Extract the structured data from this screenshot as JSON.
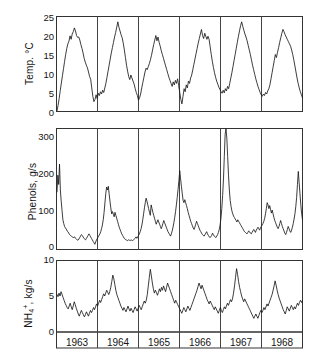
{
  "figure": {
    "background": "#ffffff",
    "line_color": "#1a1a1a",
    "frame_color": "#333333"
  },
  "panels": {
    "temperature": {
      "axis_label": "Temp. °C",
      "tick_labels": [
        "0",
        "5",
        "10",
        "15",
        "20",
        "25"
      ]
    },
    "phenols": {
      "axis_label": "Phenols, g/s",
      "tick_labels": [
        "0",
        "100",
        "200",
        "300"
      ]
    },
    "ammonium": {
      "axis_label_html": "NH<sub>4</sub><sup>+</sup>, kg/s",
      "axis_label": "NH4+, kg/s",
      "tick_labels": [
        "0",
        "5",
        "10"
      ]
    }
  },
  "years": [
    "1963",
    "1964",
    "1965",
    "1966",
    "1967",
    "1968"
  ],
  "chart_data": [
    {
      "type": "line",
      "title": "",
      "xlabel": "",
      "ylabel": "Temp. °C",
      "ylim": [
        0,
        25
      ],
      "yticks": [
        0,
        5,
        10,
        15,
        20,
        25
      ],
      "grid": false,
      "legend": "none",
      "x_categories": [
        "1963",
        "1964",
        "1965",
        "1966",
        "1967",
        "1968"
      ],
      "x_unit": "month",
      "series": [
        {
          "name": "Water temperature",
          "units": "°C",
          "values": [
            0.2,
            1.6,
            3.4,
            5.5,
            7.5,
            9.4,
            11.3,
            13.2,
            15.0,
            16.6,
            17.8,
            18.5,
            19.9,
            19.0,
            20.4,
            21.0,
            22.0,
            21.2,
            20.0,
            19.5,
            19.6,
            18.8,
            17.6,
            16.6,
            15.4,
            14.0,
            13.0,
            12.2,
            11.5,
            10.4,
            9.2,
            8.5,
            6.2,
            4.0,
            2.6,
            3.2,
            4.4,
            3.4,
            4.8,
            4.2,
            5.2,
            4.6,
            5.6,
            5.0,
            6.2,
            7.4,
            9.0,
            10.6,
            12.2,
            13.8,
            15.4,
            16.8,
            18.2,
            19.6,
            20.8,
            22.2,
            23.6,
            22.2,
            21.2,
            20.2,
            19.4,
            18.0,
            16.2,
            14.2,
            12.2,
            10.6,
            9.2,
            8.4,
            9.6,
            8.8,
            8.0,
            7.2,
            6.0,
            5.0,
            4.2,
            3.0,
            3.6,
            4.6,
            6.2,
            7.6,
            9.0,
            10.4,
            11.4,
            11.0,
            11.8,
            12.6,
            13.6,
            14.8,
            16.2,
            17.6,
            18.8,
            20.0,
            18.6,
            19.6,
            18.2,
            17.2,
            16.0,
            15.0,
            14.0,
            13.0,
            12.0,
            11.0,
            10.0,
            9.0,
            8.2,
            7.4,
            6.6,
            7.8,
            7.0,
            8.2,
            7.4,
            8.6,
            6.8,
            5.0,
            3.2,
            2.0,
            4.0,
            6.0,
            5.2,
            7.0,
            6.2,
            8.0,
            7.4,
            8.8,
            9.6,
            11.0,
            12.4,
            13.8,
            15.2,
            16.6,
            18.0,
            19.2,
            20.4,
            21.6,
            20.0,
            19.2,
            20.6,
            19.8,
            19.0,
            19.8,
            19.0,
            17.0,
            15.0,
            13.2,
            11.6,
            10.2,
            9.0,
            8.0,
            7.2,
            6.4,
            5.8,
            5.2,
            4.8,
            5.6,
            4.9,
            6.0,
            5.4,
            6.6,
            6.0,
            7.4,
            8.8,
            10.2,
            11.8,
            13.4,
            15.0,
            16.6,
            18.2,
            19.8,
            21.2,
            22.6,
            23.6,
            22.4,
            21.4,
            20.4,
            19.6,
            18.6,
            17.4,
            16.2,
            15.0,
            13.6,
            12.2,
            11.0,
            9.8,
            8.6,
            7.6,
            6.6,
            5.8,
            5.0,
            4.4,
            4.0,
            4.6,
            4.2,
            5.0,
            4.6,
            5.4,
            6.0,
            7.0,
            8.6,
            10.2,
            11.8,
            13.4,
            15.0,
            14.2,
            15.6,
            16.8,
            18.2,
            19.4,
            20.6,
            21.6,
            21.0,
            20.2,
            19.6,
            19.0,
            18.4,
            17.8,
            17.2,
            16.2,
            15.0,
            13.6,
            12.0,
            10.4,
            8.8,
            7.4,
            6.2,
            5.2,
            4.4,
            3.6
          ]
        }
      ]
    },
    {
      "type": "line",
      "title": "",
      "xlabel": "",
      "ylabel": "Phenols, g/s",
      "ylim": [
        0,
        340
      ],
      "yticks": [
        0,
        100,
        200,
        300
      ],
      "grid": false,
      "legend": "none",
      "x_categories": [
        "1963",
        "1964",
        "1965",
        "1966",
        "1967",
        "1968"
      ],
      "x_unit": "month",
      "series": [
        {
          "name": "Phenols discharge",
          "units": "g/s",
          "values": [
            155,
            200,
            175,
            230,
            160,
            130,
            105,
            80,
            70,
            62,
            58,
            55,
            50,
            48,
            44,
            40,
            38,
            36,
            34,
            33,
            32,
            34,
            30,
            28,
            26,
            25,
            28,
            32,
            36,
            40,
            38,
            34,
            30,
            28,
            26,
            30,
            34,
            38,
            42,
            38,
            34,
            30,
            26,
            22,
            18,
            14,
            20,
            26,
            30,
            34,
            38,
            42,
            48,
            56,
            66,
            80,
            100,
            125,
            150,
            168,
            160,
            170,
            150,
            130,
            112,
            96,
            102,
            95,
            88,
            100,
            92,
            84,
            76,
            68,
            60,
            54,
            48,
            42,
            38,
            34,
            30,
            28,
            26,
            25,
            24,
            26,
            25,
            24,
            26,
            25,
            24,
            26,
            28,
            30,
            34,
            30,
            34,
            38,
            42,
            48,
            56,
            66,
            80,
            96,
            112,
            126,
            138,
            130,
            120,
            110,
            100,
            92,
            120,
            110,
            100,
            92,
            84,
            76,
            68,
            74,
            80,
            74,
            68,
            62,
            56,
            62,
            70,
            78,
            72,
            66,
            60,
            54,
            48,
            44,
            40,
            36,
            42,
            50,
            60,
            72,
            86,
            102,
            120,
            140,
            162,
            186,
            212,
            190,
            170,
            150,
            132,
            126,
            134,
            126,
            118,
            110,
            100,
            92,
            84,
            76,
            70,
            64,
            58,
            54,
            60,
            68,
            76,
            70,
            64,
            58,
            52,
            48,
            44,
            40,
            38,
            36,
            40,
            44,
            48,
            42,
            38,
            34,
            32,
            34,
            38,
            44,
            40,
            36,
            34,
            32,
            36,
            40,
            46,
            54,
            66,
            84,
            110,
            145,
            190,
            250,
            310,
            340,
            300,
            250,
            200,
            160,
            132,
            116,
            104,
            96,
            90,
            86,
            82,
            78,
            74,
            80,
            76,
            72,
            68,
            64,
            60,
            56,
            52,
            48,
            46,
            44,
            42,
            46,
            50,
            48,
            44,
            42,
            46,
            50,
            54,
            50,
            46,
            52,
            56,
            60,
            56,
            52,
            58,
            62,
            66,
            70,
            76,
            84,
            96,
            110,
            126,
            120,
            110,
            118,
            108,
            98,
            106,
            96,
            86,
            78,
            72,
            66,
            60,
            56,
            62,
            70,
            78,
            70,
            62,
            56,
            50,
            44,
            40,
            46,
            54,
            62,
            56,
            50,
            46,
            52,
            60,
            70,
            82,
            96,
            115,
            140,
            175,
            210,
            180,
            150,
            120,
            96,
            80
          ]
        }
      ]
    },
    {
      "type": "line",
      "title": "",
      "xlabel": "",
      "ylabel": "NH4+, kg/s",
      "ylim": [
        0,
        10
      ],
      "yticks": [
        0,
        5,
        10
      ],
      "grid": false,
      "legend": "none",
      "x_categories": [
        "1963",
        "1964",
        "1965",
        "1966",
        "1967",
        "1968"
      ],
      "x_unit": "month",
      "series": [
        {
          "name": "Ammonium discharge",
          "units": "kg/s",
          "values": [
            5.2,
            4.9,
            5.4,
            5.0,
            5.6,
            5.2,
            4.8,
            4.4,
            4.0,
            3.7,
            3.4,
            3.2,
            3.6,
            4.0,
            3.5,
            3.1,
            3.6,
            4.2,
            3.8,
            3.3,
            2.9,
            2.5,
            2.2,
            2.6,
            3.0,
            2.7,
            2.4,
            2.1,
            2.4,
            2.8,
            2.5,
            2.2,
            2.6,
            3.0,
            2.7,
            3.0,
            3.4,
            3.1,
            3.5,
            3.9,
            3.6,
            4.0,
            4.4,
            4.1,
            4.5,
            4.9,
            5.3,
            5.0,
            5.4,
            5.8,
            5.5,
            5.2,
            5.6,
            6.2,
            7.0,
            7.9,
            7.4,
            6.6,
            5.8,
            5.2,
            4.8,
            4.4,
            4.0,
            3.6,
            3.3,
            3.0,
            3.4,
            3.1,
            2.8,
            3.2,
            3.6,
            3.2,
            2.9,
            3.3,
            3.0,
            2.7,
            3.1,
            3.5,
            3.2,
            2.9,
            3.3,
            3.7,
            3.4,
            3.1,
            3.5,
            3.9,
            4.3,
            4.0,
            4.4,
            5.2,
            6.4,
            7.6,
            8.7,
            7.8,
            6.8,
            6.0,
            5.4,
            5.8,
            5.5,
            5.1,
            5.5,
            6.0,
            5.6,
            6.2,
            5.8,
            6.4,
            6.0,
            5.6,
            6.2,
            6.8,
            6.4,
            6.0,
            5.6,
            5.2,
            4.8,
            4.4,
            4.0,
            4.4,
            4.1,
            3.8,
            3.5,
            3.2,
            2.9,
            2.6,
            3.0,
            3.4,
            3.1,
            2.8,
            3.2,
            3.6,
            3.3,
            3.0,
            3.4,
            3.8,
            4.2,
            4.6,
            5.0,
            5.4,
            5.8,
            6.3,
            6.8,
            6.4,
            6.0,
            6.5,
            6.1,
            5.7,
            5.3,
            4.9,
            4.5,
            4.2,
            3.9,
            4.3,
            4.0,
            3.7,
            3.4,
            3.1,
            3.5,
            3.2,
            2.9,
            2.6,
            3.0,
            3.4,
            3.0,
            2.7,
            3.1,
            3.5,
            3.2,
            3.6,
            4.0,
            3.7,
            4.1,
            4.5,
            4.2,
            4.6,
            5.4,
            6.4,
            7.6,
            8.8,
            8.0,
            7.0,
            6.2,
            5.6,
            5.0,
            4.6,
            4.2,
            4.6,
            4.3,
            4.0,
            3.7,
            3.4,
            3.1,
            2.8,
            2.5,
            2.2,
            1.9,
            2.2,
            2.5,
            2.2,
            1.9,
            2.3,
            2.7,
            3.0,
            2.7,
            3.0,
            3.4,
            3.1,
            3.5,
            3.9,
            3.6,
            4.0,
            4.4,
            4.8,
            5.2,
            5.8,
            6.4,
            7.1,
            6.5,
            5.8,
            5.2,
            4.7,
            4.3,
            3.9,
            3.5,
            3.1,
            2.8,
            2.5,
            3.0,
            3.5,
            3.2,
            2.9,
            3.3,
            3.7,
            3.4,
            3.1,
            3.5,
            3.2,
            3.6,
            4.0,
            3.7,
            4.1,
            4.4,
            4.1,
            4.4
          ]
        }
      ]
    }
  ]
}
